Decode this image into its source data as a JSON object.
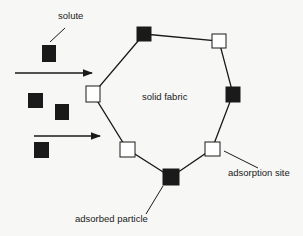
{
  "diagram": {
    "labels": {
      "solute": "solute",
      "solid_fabric": "solid fabric",
      "adsorption_site": "adsorption site",
      "adsorbed_particle": "adsorbed particle"
    },
    "colors": {
      "filled": "#1a1a1a",
      "open_fill": "#ffffff",
      "line": "#1a1a1a",
      "background": "#f7f7f5"
    },
    "fabric_nodes": [
      {
        "x": 144,
        "y": 34,
        "type": "adsorbed"
      },
      {
        "x": 219,
        "y": 41,
        "type": "site"
      },
      {
        "x": 233,
        "y": 94,
        "type": "adsorbed"
      },
      {
        "x": 212,
        "y": 149,
        "type": "site"
      },
      {
        "x": 171,
        "y": 177,
        "type": "adsorbed"
      },
      {
        "x": 127,
        "y": 149,
        "type": "site"
      },
      {
        "x": 93,
        "y": 94,
        "type": "site"
      }
    ],
    "solute_particles": [
      {
        "x": 49,
        "y": 53
      },
      {
        "x": 35,
        "y": 100
      },
      {
        "x": 62,
        "y": 112
      },
      {
        "x": 42,
        "y": 150
      }
    ],
    "arrows": [
      {
        "x1": 15,
        "y1": 73,
        "x2": 92,
        "y2": 73
      },
      {
        "x1": 34,
        "y1": 136,
        "x2": 100,
        "y2": 136
      }
    ]
  }
}
